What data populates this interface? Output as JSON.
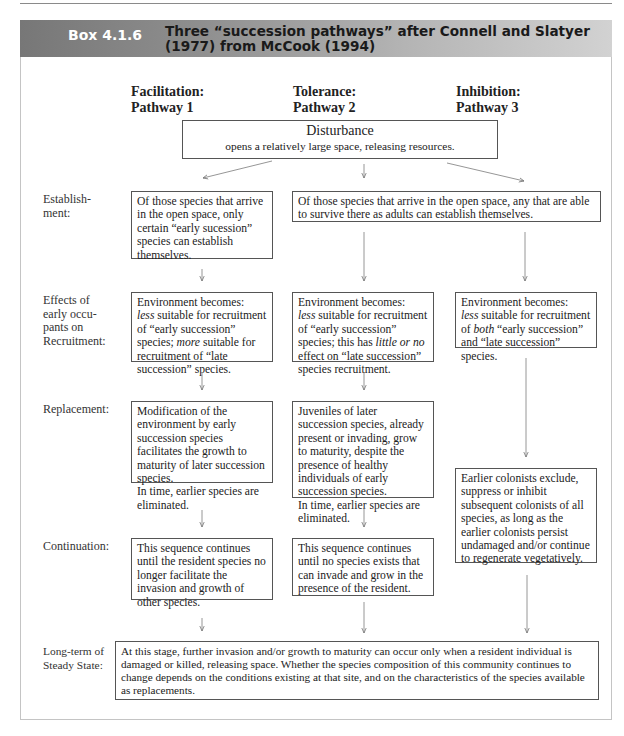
{
  "page": {
    "top_clipped_text": "Community ecology: succession and disturbance"
  },
  "header": {
    "box_id": "Box 4.1.6",
    "title": "Three “succession pathways” after Connell and Slatyer (1977) from McCook (1994)",
    "colors": {
      "gradient_start": "#777777",
      "gradient_end": "#d2d2d2",
      "box_id_text": "#ffffff"
    }
  },
  "pathways": [
    {
      "name": "Facilitation:",
      "label": "Pathway 1"
    },
    {
      "name": "Tolerance:",
      "label": "Pathway 2"
    },
    {
      "name": "Inhibition:",
      "label": "Pathway 3"
    }
  ],
  "disturbance": {
    "title": "Disturbance",
    "subtitle": "opens a relatively large space, releasing resources."
  },
  "stages": {
    "establishment": "Establish-\nment:",
    "effects": "Effects of\nearly occu-\npants on\nRecruitment:",
    "replacement": "Replacement:",
    "continuation": "Continuation:",
    "long_term": "Long-term of\nSteady State:"
  },
  "boxes": {
    "establishment_1": "Of those species that arrive in the open space, only certain “early sucession” species can establish themselves.",
    "establishment_23": "Of those species that arrive in the open space, any that are able to survive there as adults can establish themselves.",
    "effects_1": {
      "pre": "Environment becomes:",
      "em1": "less",
      "mid1": " suitable for recruitment of “early succession” species; ",
      "em2": "more",
      "post": " suitable for recruitment of “late succession” species."
    },
    "effects_2": {
      "pre": "Environment becomes:",
      "em1": "less",
      "mid1": " suitable for recruitment of  “early succession” species; this has ",
      "em2": "little or no",
      "post": " effect on “late succession” species recruitment."
    },
    "effects_3": {
      "pre": "Environment becomes:",
      "em1": "less",
      "mid1": " suitable for recruitment of ",
      "em2": "both",
      "post": " “early succession” and “late succession” species."
    },
    "replacement_1": "Modification of the environment by early succession species facilitates the growth to maturity of later succession species.",
    "replacement_1b": "In time, earlier species are eliminated.",
    "replacement_2": "Juveniles of later succession species, already present or invading, grow to maturity, despite the presence of healthy individuals of early succession species.",
    "replacement_2b": "In time, earlier species are eliminated.",
    "inhibition_3": "Earlier colonists exclude, suppress or inhibit subsequent colonists of all species, as long as the earlier colonists persist undamaged and/or continue to regenerate vegetatively.",
    "continuation_1": "This sequence continues until the resident species no longer facilitate the invasion and growth of other species.",
    "continuation_2": "This sequence continues until no species exists that can invade and grow in the presence of the resident.",
    "long_term": "At this stage, further invasion and/or growth to maturity can occur only when a resident individual is damaged or killed, releasing space. Whether the species composition of this community continues to change depends on the conditions existing at that site, and on the characteristics of the species available as replacements."
  }
}
